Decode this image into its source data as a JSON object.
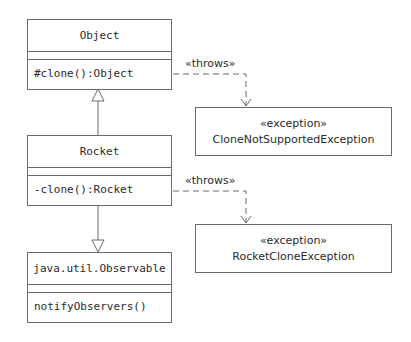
{
  "classes": [
    {
      "id": "object",
      "name": "Object",
      "attributes": [],
      "operations": [
        "#clone():Object"
      ]
    },
    {
      "id": "rocket",
      "name": "Rocket",
      "attributes": [],
      "operations": [
        "-clone():Rocket"
      ]
    },
    {
      "id": "observable",
      "name": "java.util.Observable",
      "attributes": [],
      "operations": [
        "notifyObservers()"
      ]
    }
  ],
  "exceptions": [
    {
      "id": "clone-not-supported",
      "stereotype": "«exception»",
      "name": "CloneNotSupportedException"
    },
    {
      "id": "rocket-clone",
      "stereotype": "«exception»",
      "name": "RocketCloneException"
    }
  ],
  "relationships": [
    {
      "type": "generalization",
      "from": "rocket",
      "to": "object"
    },
    {
      "type": "generalization",
      "from": "rocket",
      "to": "observable"
    },
    {
      "type": "dependency",
      "from": "object",
      "to": "clone-not-supported",
      "label": "«throws»"
    },
    {
      "type": "dependency",
      "from": "rocket",
      "to": "rocket-clone",
      "label": "«throws»"
    }
  ],
  "colors": {
    "line": "#6b6b6b",
    "text": "#2a2a2a",
    "background": "#ffffff"
  }
}
